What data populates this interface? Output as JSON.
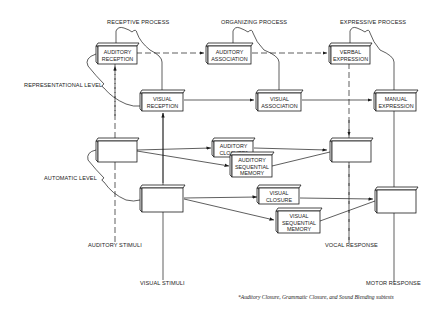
{
  "diagram": {
    "columns": [
      {
        "id": "receptive",
        "label": "RECEPTIVE PROCESS"
      },
      {
        "id": "organizing",
        "label": "ORGANIZING PROCESS"
      },
      {
        "id": "expressive",
        "label": "EXPRESSIVE PROCESS"
      }
    ],
    "levels": [
      {
        "id": "representational",
        "label": "REPRESENTATIONAL LEVEL"
      },
      {
        "id": "automatic",
        "label": "AUTOMATIC LEVEL"
      }
    ],
    "boxes": {
      "auditory_reception": [
        "AUDITORY",
        "RECEPTION"
      ],
      "auditory_association": [
        "AUDITORY",
        "ASSOCIATION"
      ],
      "verbal_expression": [
        "VERBAL",
        "EXPRESSION"
      ],
      "visual_reception": [
        "VISUAL",
        "RECEPTION"
      ],
      "visual_association": [
        "VISUAL",
        "ASSOCIATION"
      ],
      "manual_expression": [
        "MANUAL",
        "EXPRESSION"
      ],
      "auditory_closure": [
        "AUDITORY",
        "CLOSURE*"
      ],
      "auditory_sequential_memory": [
        "AUDITORY",
        "SEQUENTIAL",
        "MEMORY"
      ],
      "visual_closure": [
        "VISUAL",
        "CLOSURE"
      ],
      "visual_sequential_memory": [
        "VISUAL",
        "SEQUENTIAL",
        "MEMORY"
      ]
    },
    "endpoints": {
      "auditory_stimuli": "AUDITORY STIMULI",
      "visual_stimuli": "VISUAL STIMULI",
      "vocal_response": "VOCAL RESPONSE",
      "motor_response": "MOTOR RESPONSE"
    },
    "footnote": "*Auditory Closure, Grammatic Closure, and Sound Blending subtests"
  }
}
